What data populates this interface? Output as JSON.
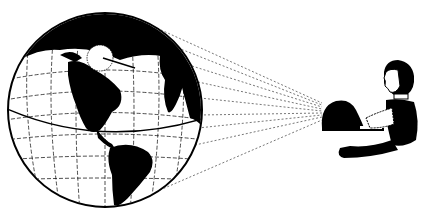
{
  "illustration": {
    "description": "Black and white line illustration: a globe showing the Americas with dashed lines converging onto a seated person typing on a laptop",
    "colors": {
      "ink": "#000000",
      "paper": "#ffffff",
      "sightline": "#555555"
    },
    "globe": {
      "cx": 105,
      "cy": 110,
      "r": 97,
      "label": "globe"
    },
    "sightlines": {
      "target": {
        "x": 322,
        "y": 110
      },
      "count": 9
    },
    "person": {
      "label": "person-with-laptop"
    }
  }
}
